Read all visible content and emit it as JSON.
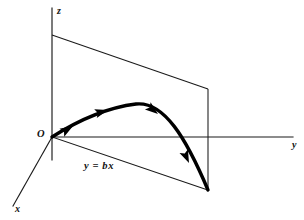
{
  "figure": {
    "type": "3d-coordinate-diagram",
    "width": 304,
    "height": 220,
    "background_color": "#ffffff",
    "line_color": "#1a1a1a",
    "curve_color": "#000000"
  },
  "axes": {
    "z": {
      "label": "z",
      "orientation": "vertical-up",
      "line": {
        "x1": 52,
        "y1": 8,
        "x2": 52,
        "y2": 160
      },
      "label_position": {
        "x": 57,
        "y": 6
      }
    },
    "y": {
      "label": "y",
      "orientation": "horizontal-right",
      "line": {
        "x1": 52,
        "y1": 137,
        "x2": 293,
        "y2": 137
      },
      "label_position": {
        "x": 292,
        "y": 140
      }
    },
    "x": {
      "label": "x",
      "orientation": "diagonal-down-left",
      "line": {
        "x1": 52,
        "y1": 137,
        "x2": 13,
        "y2": 206
      },
      "label_position": {
        "x": 15,
        "y": 204
      }
    }
  },
  "origin": {
    "label": "O",
    "point": {
      "x": 52,
      "y": 137
    },
    "label_position": {
      "x": 37,
      "y": 129
    }
  },
  "plane": {
    "label": "y = bx",
    "label_position": {
      "x": 84,
      "y": 161
    },
    "corners": [
      {
        "x": 52,
        "y": 35
      },
      {
        "x": 208,
        "y": 89
      },
      {
        "x": 208,
        "y": 190
      },
      {
        "x": 52,
        "y": 137
      }
    ],
    "ground_line": {
      "x1": 52,
      "y1": 137,
      "x2": 208,
      "y2": 190
    },
    "vertical_edge": {
      "x1": 208,
      "y1": 89,
      "x2": 208,
      "y2": 190
    }
  },
  "trajectory": {
    "name": "projectile-path",
    "start_point": {
      "x": 52,
      "y": 137
    },
    "apex_point": {
      "x": 135,
      "y": 104
    },
    "end_point": {
      "x": 208,
      "y": 190
    },
    "stroke_width": 3.4,
    "path": "M 52 137 C 74 123, 104 108, 136 104 C 164 101, 186 138, 208 190",
    "direction_markers": [
      {
        "index": 1,
        "x": 73,
        "y": 126,
        "angle": -31
      },
      {
        "index": 2,
        "x": 108,
        "y": 110,
        "angle": -16
      },
      {
        "index": 3,
        "x": 158,
        "y": 114,
        "angle": 38
      },
      {
        "index": 4,
        "x": 189,
        "y": 163,
        "angle": 66
      }
    ]
  }
}
